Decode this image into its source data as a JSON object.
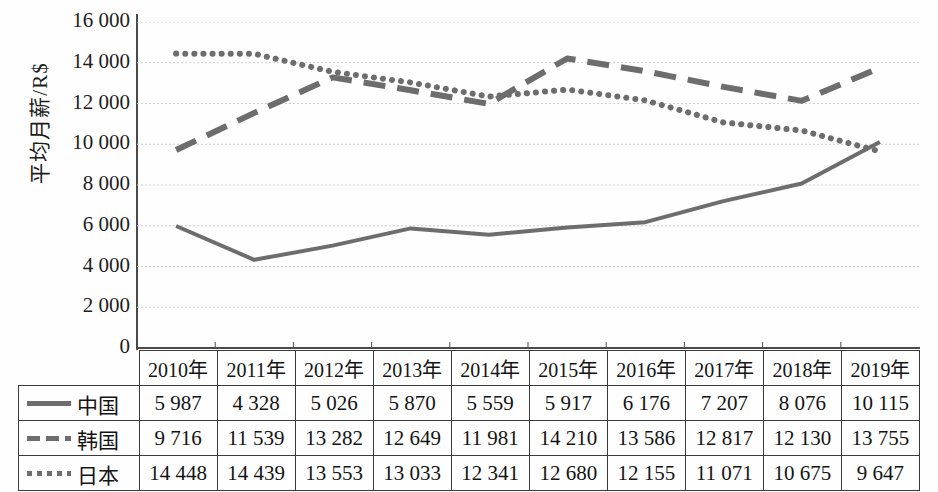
{
  "chart_data": {
    "type": "line",
    "title": "",
    "xlabel": "",
    "ylabel": "平均月薪/R$",
    "ylim": [
      0,
      16000
    ],
    "ytick_step": 2000,
    "grid": true,
    "legend_position": "table-left",
    "categories": [
      "2010年",
      "2011年",
      "2012年",
      "2013年",
      "2014年",
      "2015年",
      "2016年",
      "2017年",
      "2018年",
      "2019年"
    ],
    "ytick_labels": [
      "16 000",
      "14 000",
      "12 000",
      "10 000",
      "8 000",
      "6 000",
      "4 000",
      "2 000",
      "0"
    ],
    "ytick_values": [
      16000,
      14000,
      12000,
      10000,
      8000,
      6000,
      4000,
      2000,
      0
    ],
    "series": [
      {
        "name": "中国",
        "style": "solid",
        "color": "#6d6d6d",
        "values": [
          5987,
          4328,
          5026,
          5870,
          5559,
          5917,
          6176,
          7207,
          8076,
          10115
        ],
        "labels": [
          "5 987",
          "4 328",
          "5 026",
          "5 870",
          "5 559",
          "5 917",
          "6 176",
          "7 207",
          "8 076",
          "10 115"
        ]
      },
      {
        "name": "韩国",
        "style": "dashed",
        "color": "#6d6d6d",
        "values": [
          9716,
          11539,
          13282,
          12649,
          11981,
          14210,
          13586,
          12817,
          12130,
          13755
        ],
        "labels": [
          "9 716",
          "11 539",
          "13 282",
          "12 649",
          "11 981",
          "14 210",
          "13 586",
          "12 817",
          "12 130",
          "13 755"
        ]
      },
      {
        "name": "日本",
        "style": "dotted",
        "color": "#6d6d6d",
        "values": [
          14448,
          14439,
          13553,
          13033,
          12341,
          12680,
          12155,
          11071,
          10675,
          9647
        ],
        "labels": [
          "14 448",
          "14 439",
          "13 553",
          "13 033",
          "12 341",
          "12 680",
          "12 155",
          "11 071",
          "10 675",
          "9 647"
        ]
      }
    ]
  },
  "colors": {
    "line": "#6d6d6d",
    "axis": "#4a4a4a",
    "grid": "#cfcfcf",
    "text": "#141414"
  }
}
